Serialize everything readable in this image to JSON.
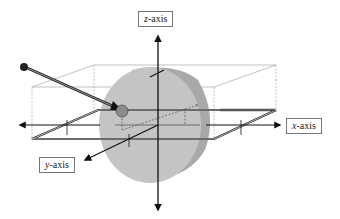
{
  "diagram": {
    "labels": {
      "z_axis": {
        "var": "z",
        "suffix": "-axis"
      },
      "x_axis": {
        "var": "x",
        "suffix": "-axis"
      },
      "y_axis": {
        "var": "y",
        "suffix": "-axis"
      }
    },
    "colors": {
      "cylinder_face": "#c4c4c4",
      "cylinder_side": "#a9a9a9",
      "probe_ball": "#8c8c8c",
      "axis": "#111111",
      "box_edge": "#999999"
    }
  }
}
